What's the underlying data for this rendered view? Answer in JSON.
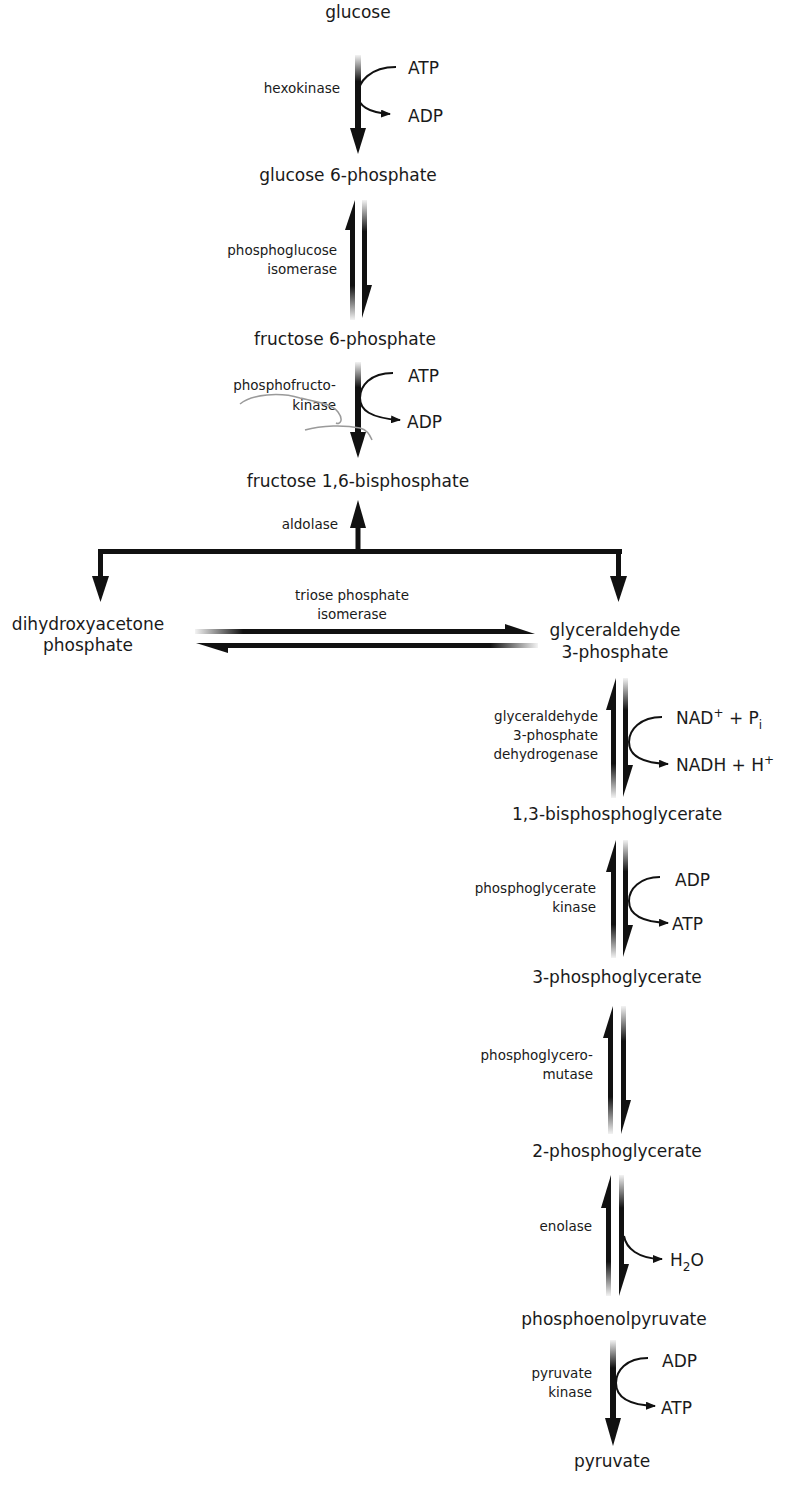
{
  "colors": {
    "ink": "#111111",
    "text": "#1a1a1a",
    "background": "#ffffff",
    "pencil": "#9a9a9a"
  },
  "metabolites": {
    "glucose": "glucose",
    "g6p": "glucose 6-phosphate",
    "f6p": "fructose 6-phosphate",
    "f16bp": "fructose 1,6-bisphosphate",
    "dhap_1": "dihydroxyacetone",
    "dhap_2": "phosphate",
    "gap_1": "glyceraldehyde",
    "gap_2": "3-phosphate",
    "bpg13": "1,3-bisphosphoglycerate",
    "pg3": "3-phosphoglycerate",
    "pg2": "2-phosphoglycerate",
    "pep": "phosphoenolpyruvate",
    "pyruvate": "pyruvate"
  },
  "enzymes": {
    "hexokinase": "hexokinase",
    "pgi_1": "phosphoglucose",
    "pgi_2": "isomerase",
    "pfk_1": "phosphofructo-",
    "pfk_2": "kinase",
    "aldolase": "aldolase",
    "tpi_1": "triose phosphate",
    "tpi_2": "isomerase",
    "gapdh_1": "glyceraldehyde",
    "gapdh_2": "3-phosphate",
    "gapdh_3": "dehydrogenase",
    "pgk_1": "phosphoglycerate",
    "pgk_2": "kinase",
    "pgm_1": "phosphoglycero-",
    "pgm_2": "mutase",
    "enolase": "enolase",
    "pk_1": "pyruvate",
    "pk_2": "kinase"
  },
  "cofactors": {
    "hk_in": "ATP",
    "hk_out": "ADP",
    "pfk_in": "ATP",
    "pfk_out": "ADP",
    "gapdh_in": {
      "a": "NAD",
      "a_sup": "+",
      "b": " + P",
      "b_sub": "i"
    },
    "gapdh_out": {
      "a": "NADH + H",
      "a_sup": "+"
    },
    "pgk_in": "ADP",
    "pgk_out": "ATP",
    "eno_out": {
      "a": "H",
      "a_sub": "2",
      "b": "O"
    },
    "pk_in": "ADP",
    "pk_out": "ATP"
  }
}
